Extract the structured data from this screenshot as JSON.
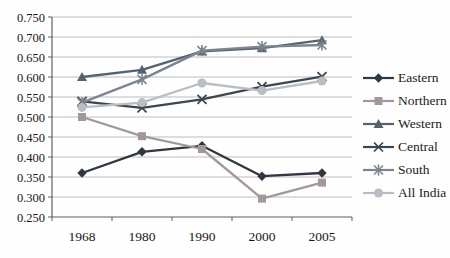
{
  "chart_data": {
    "type": "line",
    "title": "",
    "xlabel": "",
    "ylabel": "",
    "categories": [
      "1968",
      "1980",
      "1990",
      "2000",
      "2005"
    ],
    "series": [
      {
        "name": "Eastern",
        "marker": "diamond",
        "color": "#2f3742",
        "values": [
          0.36,
          0.413,
          0.428,
          0.352,
          0.36
        ]
      },
      {
        "name": "Northern",
        "marker": "square",
        "color": "#a3979c",
        "values": [
          0.5,
          0.452,
          0.42,
          0.296,
          0.336
        ]
      },
      {
        "name": "Western",
        "marker": "triangle",
        "color": "#55626f",
        "values": [
          0.6,
          0.618,
          0.664,
          0.672,
          0.692
        ]
      },
      {
        "name": "Central",
        "marker": "x",
        "color": "#3c4650",
        "values": [
          0.539,
          0.523,
          0.544,
          0.576,
          0.601
        ]
      },
      {
        "name": "South",
        "marker": "star",
        "color": "#7b8590",
        "values": [
          0.536,
          0.594,
          0.666,
          0.676,
          0.68
        ]
      },
      {
        "name": "All India",
        "marker": "circle",
        "color": "#b8bec3",
        "values": [
          0.524,
          0.536,
          0.585,
          0.566,
          0.59
        ]
      }
    ],
    "ylim": [
      0.25,
      0.75
    ],
    "y_tick_labels": [
      "0.250",
      "0.300",
      "0.350",
      "0.400",
      "0.450",
      "0.500",
      "0.550",
      "0.600",
      "0.650",
      "0.700",
      "0.750"
    ],
    "grid": "horizontal",
    "legend_position": "right"
  },
  "style_colors": {
    "gridline": "#bdbdbd",
    "axis": "#5f5f5f",
    "tick_text": "#171717",
    "background": "#fefefe"
  }
}
